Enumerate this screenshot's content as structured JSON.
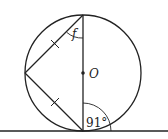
{
  "diagram": {
    "type": "circle-geometry",
    "stroke_color": "#222222",
    "background": "#ffffff",
    "center_label": "O",
    "angle_unknown_label": "f",
    "angle_known_label": "91°",
    "tangent_line": true,
    "equal_chord_marks": 2
  }
}
